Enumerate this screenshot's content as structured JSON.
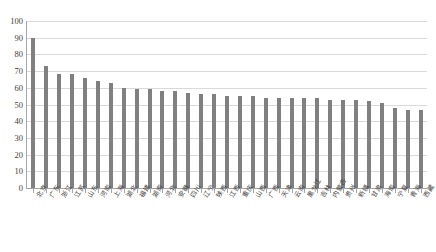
{
  "chart_data": {
    "type": "bar",
    "title": "",
    "xlabel": "",
    "ylabel": "",
    "ylim": [
      0,
      100
    ],
    "y_ticks": [
      0,
      10,
      20,
      30,
      40,
      50,
      60,
      70,
      80,
      90,
      100
    ],
    "grid": true,
    "legend": "none",
    "bar_color": "#808080",
    "gridline_color": "#d9d9d9",
    "axis_color": "#a6a6a6",
    "categories": [
      "北京",
      "广东",
      "浙江",
      "江苏",
      "山东",
      "河南",
      "上海",
      "湖北",
      "福建",
      "湖南",
      "河北",
      "安徽",
      "四川",
      "辽宁",
      "陕西",
      "江西",
      "重庆",
      "山西",
      "广西",
      "天津",
      "云南",
      "黑龙江",
      "吉林",
      "内蒙古",
      "贵州",
      "新疆",
      "甘肃",
      "海南",
      "宁夏",
      "青海",
      "西藏"
    ],
    "values": [
      90,
      73,
      68,
      68,
      66,
      64,
      63,
      60,
      59,
      59,
      58,
      58,
      57,
      56,
      56,
      55,
      55,
      55,
      54,
      54,
      54,
      54,
      54,
      53,
      53,
      53,
      52,
      51,
      48,
      47,
      47
    ],
    "series": [
      {
        "name": "指数值",
        "values": [
          90,
          73,
          68,
          68,
          66,
          64,
          63,
          60,
          59,
          59,
          58,
          58,
          57,
          56,
          56,
          55,
          55,
          55,
          54,
          54,
          54,
          54,
          54,
          53,
          53,
          53,
          52,
          51,
          48,
          47,
          47
        ]
      }
    ]
  }
}
